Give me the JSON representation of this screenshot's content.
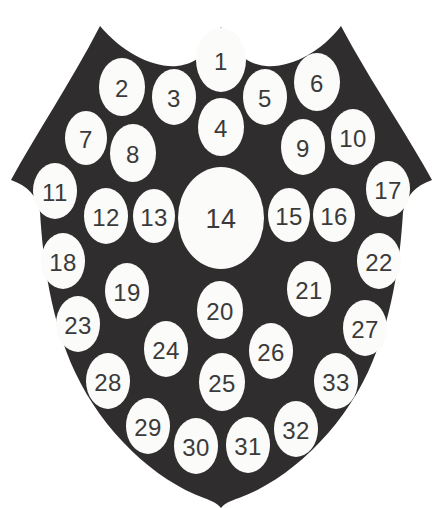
{
  "figure": {
    "shape_name": "heraldic-shield",
    "background_color": "#ffffff",
    "shield_fill_color": "#2f2d2e",
    "marker_fill_color": "#fbfbf9",
    "label_color": "#3a3a3a",
    "marker_count": 33,
    "canvas": {
      "width": 443,
      "height": 508
    }
  },
  "chart_data": {
    "type": "scatter",
    "xlabel": "",
    "ylabel": "",
    "xlim": [
      0,
      443
    ],
    "ylim": [
      0,
      508
    ],
    "grid": false,
    "legend": "none",
    "annotations": [
      "Shield outline with three top lobes and a pointed base",
      "33 white ellipses numbered 1 through 33",
      "Ellipse 14 at the center is noticeably larger than the rest"
    ],
    "points": [
      {
        "label": "1",
        "x": 221,
        "y": 60,
        "rx": 25,
        "ry": 32
      },
      {
        "label": "2",
        "x": 122,
        "y": 87,
        "rx": 23,
        "ry": 29
      },
      {
        "label": "3",
        "x": 174,
        "y": 97,
        "rx": 22,
        "ry": 28
      },
      {
        "label": "4",
        "x": 221,
        "y": 127,
        "rx": 23,
        "ry": 29
      },
      {
        "label": "5",
        "x": 265,
        "y": 97,
        "rx": 22,
        "ry": 28
      },
      {
        "label": "6",
        "x": 317,
        "y": 82,
        "rx": 23,
        "ry": 29
      },
      {
        "label": "7",
        "x": 86,
        "y": 138,
        "rx": 21,
        "ry": 27
      },
      {
        "label": "8",
        "x": 133,
        "y": 153,
        "rx": 23,
        "ry": 29
      },
      {
        "label": "9",
        "x": 303,
        "y": 147,
        "rx": 22,
        "ry": 28
      },
      {
        "label": "10",
        "x": 353,
        "y": 137,
        "rx": 22,
        "ry": 28
      },
      {
        "label": "11",
        "x": 55,
        "y": 191,
        "rx": 22,
        "ry": 28
      },
      {
        "label": "12",
        "x": 106,
        "y": 216,
        "rx": 22,
        "ry": 28
      },
      {
        "label": "13",
        "x": 154,
        "y": 216,
        "rx": 21,
        "ry": 27
      },
      {
        "label": "14",
        "x": 221,
        "y": 218,
        "rx": 43,
        "ry": 51
      },
      {
        "label": "15",
        "x": 289,
        "y": 215,
        "rx": 21,
        "ry": 27
      },
      {
        "label": "16",
        "x": 334,
        "y": 215,
        "rx": 21,
        "ry": 27
      },
      {
        "label": "17",
        "x": 388,
        "y": 189,
        "rx": 22,
        "ry": 28
      },
      {
        "label": "18",
        "x": 63,
        "y": 261,
        "rx": 22,
        "ry": 28
      },
      {
        "label": "19",
        "x": 127,
        "y": 291,
        "rx": 22,
        "ry": 28
      },
      {
        "label": "20",
        "x": 220,
        "y": 310,
        "rx": 23,
        "ry": 29
      },
      {
        "label": "21",
        "x": 309,
        "y": 289,
        "rx": 22,
        "ry": 28
      },
      {
        "label": "22",
        "x": 379,
        "y": 261,
        "rx": 22,
        "ry": 28
      },
      {
        "label": "23",
        "x": 78,
        "y": 324,
        "rx": 22,
        "ry": 28
      },
      {
        "label": "24",
        "x": 166,
        "y": 349,
        "rx": 22,
        "ry": 28
      },
      {
        "label": "25",
        "x": 222,
        "y": 382,
        "rx": 23,
        "ry": 29
      },
      {
        "label": "26",
        "x": 271,
        "y": 351,
        "rx": 22,
        "ry": 28
      },
      {
        "label": "27",
        "x": 365,
        "y": 328,
        "rx": 22,
        "ry": 28
      },
      {
        "label": "28",
        "x": 108,
        "y": 381,
        "rx": 22,
        "ry": 28
      },
      {
        "label": "29",
        "x": 148,
        "y": 426,
        "rx": 22,
        "ry": 28
      },
      {
        "label": "30",
        "x": 196,
        "y": 446,
        "rx": 22,
        "ry": 28
      },
      {
        "label": "31",
        "x": 248,
        "y": 445,
        "rx": 22,
        "ry": 28
      },
      {
        "label": "32",
        "x": 296,
        "y": 429,
        "rx": 22,
        "ry": 28
      },
      {
        "label": "33",
        "x": 336,
        "y": 381,
        "rx": 22,
        "ry": 28
      }
    ]
  },
  "shield_outline": {
    "path": "M 100 26 C 122 52 152 68 177 66 C 199 64 212 48 221 27 C 230 48 244 64 266 66 C 291 68 321 52 341 26 C 372 84 407 134 432 180 C 415 186 406 196 403 212 C 400 262 392 320 368 372 C 340 432 288 480 239 498 C 230 501 225 503 221 508 C 217 503 212 501 204 498 C 155 480 103 432 75 372 C 51 320 43 262 40 212 C 37 196 28 186 11 180 C 36 134 70 84 100 26 Z"
  }
}
